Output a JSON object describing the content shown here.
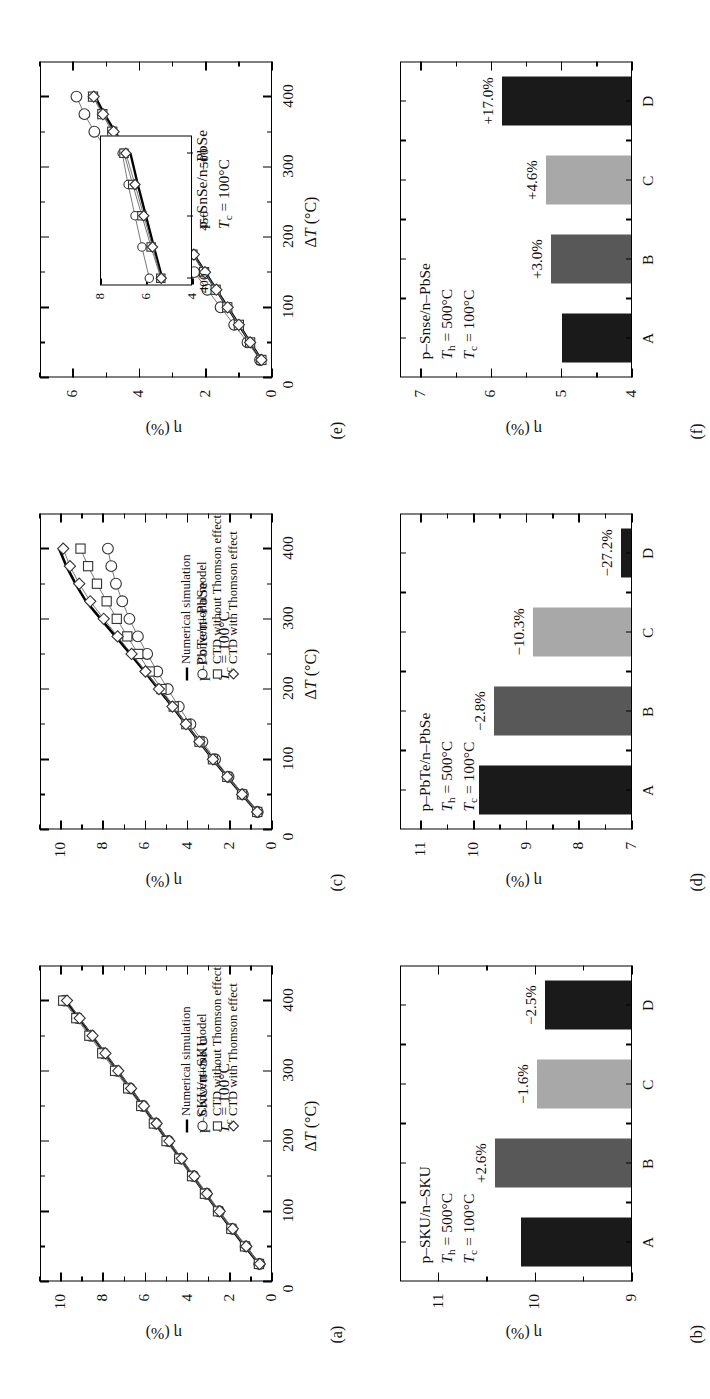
{
  "figure": {
    "axis": {
      "x_label": "ΔT (°C)",
      "y_label": "η (%)",
      "x_ticks": [
        "0",
        "100",
        "200",
        "300",
        "400"
      ],
      "x_lim": [
        0,
        450
      ]
    },
    "legend": {
      "items": [
        {
          "marker": "line",
          "label": "Numerical simulation"
        },
        {
          "marker": "circle",
          "label": "Conventional model"
        },
        {
          "marker": "square",
          "label": "CTD without Thomson effect"
        },
        {
          "marker": "diamond",
          "label": "CTD with Thomson effect"
        }
      ]
    },
    "bar_colors": {
      "A": "#1a1a1a",
      "B": "#585858",
      "C": "#a8a8a8",
      "D": "#1a1a1a"
    }
  },
  "panels": [
    {
      "id": "a",
      "label": "(a)",
      "kind": "line",
      "caption_lines": [
        "p–SKU/n–SKU",
        "T_c = 100°C"
      ],
      "material": "p–SKU/n–SKU",
      "tc_text": "T",
      "tc_sub": "c",
      "tc_rest": " = 100°C",
      "y_ticks": [
        "0",
        "2",
        "4",
        "6",
        "8",
        "10"
      ],
      "y_lim": [
        0,
        11
      ],
      "has_legend": true,
      "has_inset": false
    },
    {
      "id": "c",
      "label": "(c)",
      "kind": "line",
      "caption_lines": [
        "p–PbTe/n–PbSe",
        "T_c = 100°C"
      ],
      "material": "p–PbTe/n–PbSe",
      "tc_text": "T",
      "tc_sub": "c",
      "tc_rest": " = 100°C",
      "y_ticks": [
        "0",
        "2",
        "4",
        "6",
        "8",
        "10"
      ],
      "y_lim": [
        0,
        11
      ],
      "has_legend": true,
      "has_inset": false
    },
    {
      "id": "e",
      "label": "(e)",
      "kind": "line",
      "caption_lines": [
        "p–SnSe/n–PbSe",
        "T_c = 100°C"
      ],
      "material": "p–SnSe/n–PbSe",
      "tc_text": "T",
      "tc_sub": "c",
      "tc_rest": " = 100°C",
      "y_ticks": [
        "0",
        "2",
        "4",
        "6"
      ],
      "y_lim": [
        0,
        7
      ],
      "has_legend": false,
      "has_inset": true,
      "inset": {
        "x_ticks": [
          "400",
          "450",
          "500"
        ],
        "y_ticks": [
          "4",
          "6",
          "8"
        ],
        "x_lim": [
          395,
          515
        ],
        "y_lim": [
          4,
          8
        ]
      }
    },
    {
      "id": "b",
      "label": "(b)",
      "kind": "bar",
      "material": "p–SKU/n–SKU",
      "th_rest": " = 500°C",
      "tc_rest": " = 100°C",
      "y_ticks": [
        "9",
        "10",
        "11"
      ],
      "y_lim": [
        9,
        11.4
      ]
    },
    {
      "id": "d",
      "label": "(d)",
      "kind": "bar",
      "material": "p–PbTe/n–PbSe",
      "th_rest": " = 500°C",
      "tc_rest": " = 100°C",
      "y_ticks": [
        "7",
        "8",
        "9",
        "10",
        "11"
      ],
      "y_lim": [
        7,
        11.4
      ]
    },
    {
      "id": "f",
      "label": "(f)",
      "kind": "bar",
      "material": "p–Snse/n–PbSe",
      "th_rest": " = 500°C",
      "tc_rest": " = 100°C",
      "y_ticks": [
        "4",
        "5",
        "6",
        "7"
      ],
      "y_lim": [
        4,
        7.3
      ]
    }
  ],
  "chart_data": [
    {
      "panel": "a",
      "type": "line",
      "title": "p-SKU/n-SKU, Tc = 100 degC",
      "xlabel": "ΔT (°C)",
      "ylabel": "η (%)",
      "xlim": [
        0,
        450
      ],
      "ylim": [
        0,
        11
      ],
      "x": [
        25,
        50,
        75,
        100,
        125,
        150,
        175,
        200,
        225,
        250,
        275,
        300,
        325,
        350,
        375,
        400
      ],
      "series": [
        {
          "name": "Numerical simulation",
          "marker": "line",
          "values": [
            0.62,
            1.28,
            1.93,
            2.55,
            3.16,
            3.76,
            4.35,
            4.93,
            5.52,
            6.12,
            6.72,
            7.33,
            7.93,
            8.54,
            9.16,
            9.78
          ]
        },
        {
          "name": "Conventional model",
          "marker": "circle",
          "values": [
            0.6,
            1.25,
            1.9,
            2.52,
            3.12,
            3.73,
            4.33,
            4.92,
            5.52,
            6.12,
            6.74,
            7.36,
            7.98,
            8.6,
            9.22,
            9.85
          ]
        },
        {
          "name": "CTD without Thomson effect",
          "marker": "square",
          "values": [
            0.62,
            1.28,
            1.93,
            2.56,
            3.18,
            3.79,
            4.4,
            5.0,
            5.6,
            6.2,
            6.82,
            7.44,
            8.05,
            8.66,
            9.28,
            9.9
          ]
        },
        {
          "name": "CTD with Thomson effect",
          "marker": "diamond",
          "values": [
            0.58,
            1.22,
            1.86,
            2.48,
            3.08,
            3.68,
            4.28,
            4.87,
            5.47,
            6.07,
            6.68,
            7.29,
            7.9,
            8.51,
            9.12,
            9.72
          ]
        }
      ]
    },
    {
      "panel": "c",
      "type": "line",
      "title": "p-PbTe/n-PbSe, Tc = 100 degC",
      "xlabel": "ΔT (°C)",
      "ylabel": "η (%)",
      "xlim": [
        0,
        450
      ],
      "ylim": [
        0,
        11
      ],
      "x": [
        25,
        50,
        75,
        100,
        125,
        150,
        175,
        200,
        225,
        250,
        275,
        300,
        325,
        350,
        375,
        400
      ],
      "series": [
        {
          "name": "Numerical simulation",
          "marker": "line",
          "values": [
            0.7,
            1.42,
            2.12,
            2.8,
            3.44,
            4.08,
            4.72,
            5.38,
            6.04,
            6.72,
            7.42,
            8.12,
            8.82,
            9.32,
            9.75,
            10.1
          ]
        },
        {
          "name": "Conventional model",
          "marker": "circle",
          "values": [
            0.68,
            1.38,
            2.06,
            2.7,
            3.3,
            3.87,
            4.42,
            4.94,
            5.44,
            5.92,
            6.36,
            6.76,
            7.1,
            7.4,
            7.62,
            7.78
          ]
        },
        {
          "name": "CTD without Thomson effect",
          "marker": "square",
          "values": [
            0.7,
            1.42,
            2.12,
            2.8,
            3.44,
            4.06,
            4.66,
            5.24,
            5.8,
            6.34,
            6.86,
            7.36,
            7.84,
            8.3,
            8.72,
            9.08
          ]
        },
        {
          "name": "CTD with Thomson effect",
          "marker": "diamond",
          "values": [
            0.7,
            1.42,
            2.12,
            2.8,
            3.44,
            4.08,
            4.72,
            5.36,
            6.0,
            6.66,
            7.32,
            7.98,
            8.62,
            9.14,
            9.58,
            9.9
          ]
        }
      ]
    },
    {
      "panel": "e",
      "type": "line",
      "title": "p-SnSe/n-PbSe, Tc = 100 degC",
      "xlabel": "ΔT (°C)",
      "ylabel": "η (%)",
      "xlim": [
        0,
        450
      ],
      "ylim": [
        0,
        7
      ],
      "x": [
        25,
        50,
        75,
        100,
        125,
        150,
        175,
        200,
        225,
        250,
        275,
        300,
        325,
        350,
        375,
        400
      ],
      "series": [
        {
          "name": "Numerical simulation",
          "marker": "line",
          "values": [
            0.32,
            0.66,
            1.0,
            1.34,
            1.68,
            2.02,
            2.36,
            2.7,
            3.04,
            3.38,
            3.72,
            4.06,
            4.4,
            4.74,
            5.06,
            5.34
          ]
        },
        {
          "name": "Conventional model",
          "marker": "circle",
          "values": [
            0.36,
            0.74,
            1.14,
            1.55,
            1.95,
            2.35,
            2.74,
            3.12,
            3.5,
            3.88,
            4.26,
            4.63,
            5.0,
            5.36,
            5.66,
            5.9
          ]
        },
        {
          "name": "CTD without Thomson effect",
          "marker": "square",
          "values": [
            0.32,
            0.66,
            1.0,
            1.35,
            1.7,
            2.05,
            2.4,
            2.74,
            3.08,
            3.42,
            3.76,
            4.12,
            4.48,
            4.82,
            5.12,
            5.4
          ]
        },
        {
          "name": "CTD with Thomson effect",
          "marker": "diamond",
          "values": [
            0.32,
            0.66,
            1.0,
            1.34,
            1.68,
            2.02,
            2.36,
            2.7,
            3.04,
            3.38,
            3.72,
            4.08,
            4.44,
            4.78,
            5.1,
            5.38
          ]
        }
      ],
      "inset": {
        "xlim": [
          395,
          515
        ],
        "ylim": [
          4,
          8
        ],
        "xticks": [
          400,
          450,
          500
        ],
        "yticks": [
          4,
          6,
          8
        ],
        "x": [
          400,
          425,
          450,
          475,
          500
        ],
        "series": [
          {
            "name": "Numerical simulation",
            "marker": "line",
            "values": [
              5.34,
              5.7,
              6.05,
              6.4,
              6.72
            ]
          },
          {
            "name": "Conventional model",
            "marker": "circle",
            "values": [
              5.9,
              6.22,
              6.52,
              6.82,
              7.08
            ]
          },
          {
            "name": "CTD without Thomson effect",
            "marker": "square",
            "values": [
              5.4,
              5.82,
              6.22,
              6.62,
              7.0
            ]
          },
          {
            "name": "CTD with Thomson effect",
            "marker": "diamond",
            "values": [
              5.38,
              5.76,
              6.14,
              6.52,
              6.92
            ]
          }
        ]
      }
    },
    {
      "panel": "b",
      "type": "bar",
      "title": "p-SKU/n-SKU, Th = 500 degC, Tc = 100 degC",
      "xlabel": "",
      "ylabel": "η (%)",
      "categories": [
        "A",
        "B",
        "C",
        "D"
      ],
      "values": [
        10.15,
        10.42,
        9.98,
        9.9
      ],
      "bar_labels": [
        "",
        "+2.6%",
        "−1.6%",
        "−2.5%"
      ],
      "colors": [
        "#1a1a1a",
        "#585858",
        "#a8a8a8",
        "#1a1a1a"
      ],
      "ylim": [
        9,
        11.4
      ],
      "yticks": [
        9,
        10,
        11
      ]
    },
    {
      "panel": "d",
      "type": "bar",
      "title": "p-PbTe/n-PbSe, Th = 500 degC, Tc = 100 degC",
      "xlabel": "",
      "ylabel": "η (%)",
      "categories": [
        "A",
        "B",
        "C",
        "D"
      ],
      "values": [
        9.9,
        9.62,
        8.88,
        7.21
      ],
      "bar_labels": [
        "",
        "−2.8%",
        "−10.3%",
        "−27.2%"
      ],
      "colors": [
        "#1a1a1a",
        "#585858",
        "#a8a8a8",
        "#1a1a1a"
      ],
      "ylim": [
        7,
        11.4
      ],
      "yticks": [
        7,
        8,
        9,
        10,
        11
      ]
    },
    {
      "panel": "f",
      "type": "bar",
      "title": "p-Snse/n-PbSe, Th = 500 degC, Tc = 100 degC",
      "xlabel": "",
      "ylabel": "η (%)",
      "categories": [
        "A",
        "B",
        "C",
        "D"
      ],
      "values": [
        5.0,
        5.15,
        5.23,
        5.85
      ],
      "bar_labels": [
        "",
        "+3.0%",
        "+4.6%",
        "+17.0%"
      ],
      "colors": [
        "#1a1a1a",
        "#585858",
        "#a8a8a8",
        "#1a1a1a"
      ],
      "ylim": [
        4,
        7.3
      ],
      "yticks": [
        4,
        5,
        6,
        7
      ]
    }
  ]
}
